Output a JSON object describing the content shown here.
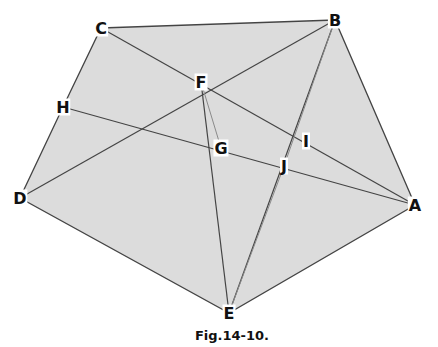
{
  "figure": {
    "caption": "Fig.14-10.",
    "fill_color": "#dcdcdc",
    "line_color": "#444444",
    "light_line_color": "#8a8a8a",
    "points": {
      "A": {
        "label": "A",
        "x": 415,
        "y": 205
      },
      "B": {
        "label": "B",
        "x": 335,
        "y": 20
      },
      "C": {
        "label": "C",
        "x": 101,
        "y": 28
      },
      "D": {
        "label": "D",
        "x": 20,
        "y": 198
      },
      "E": {
        "label": "E",
        "x": 229,
        "y": 313
      },
      "F": {
        "label": "F",
        "x": 201,
        "y": 82
      },
      "G": {
        "label": "G",
        "x": 221,
        "y": 148
      },
      "H": {
        "label": "H",
        "x": 63,
        "y": 107
      },
      "I": {
        "label": "I",
        "x": 306,
        "y": 141
      },
      "J": {
        "label": "J",
        "x": 284,
        "y": 166
      }
    },
    "polygon": [
      "C",
      "B",
      "A",
      "E",
      "D",
      "H"
    ],
    "segments": [
      {
        "from": "C",
        "to": "A",
        "style": "normal"
      },
      {
        "from": "D",
        "to": "B",
        "style": "normal"
      },
      {
        "from": "H",
        "to": "A",
        "style": "normal"
      },
      {
        "from": "F",
        "to": "E",
        "style": "normal"
      },
      {
        "from": "F",
        "to": "G",
        "style": "light"
      },
      {
        "from": "B",
        "to": "E",
        "style": "normal"
      },
      {
        "from": "B",
        "to": "J",
        "style": "light"
      },
      {
        "from": "J",
        "to": "E",
        "style": "light"
      }
    ]
  }
}
